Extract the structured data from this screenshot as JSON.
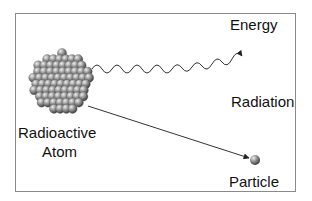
{
  "diagram": {
    "labels": {
      "energy": "Energy",
      "radiation": "Radiation",
      "atom_line1": "Radioactive",
      "atom_line2": "Atom",
      "particle": "Particle"
    },
    "colors": {
      "frame": "#8a8a8a",
      "line": "#333333",
      "sphere_light": "#d6d6d6",
      "sphere_dark": "#4a4a4a"
    }
  }
}
